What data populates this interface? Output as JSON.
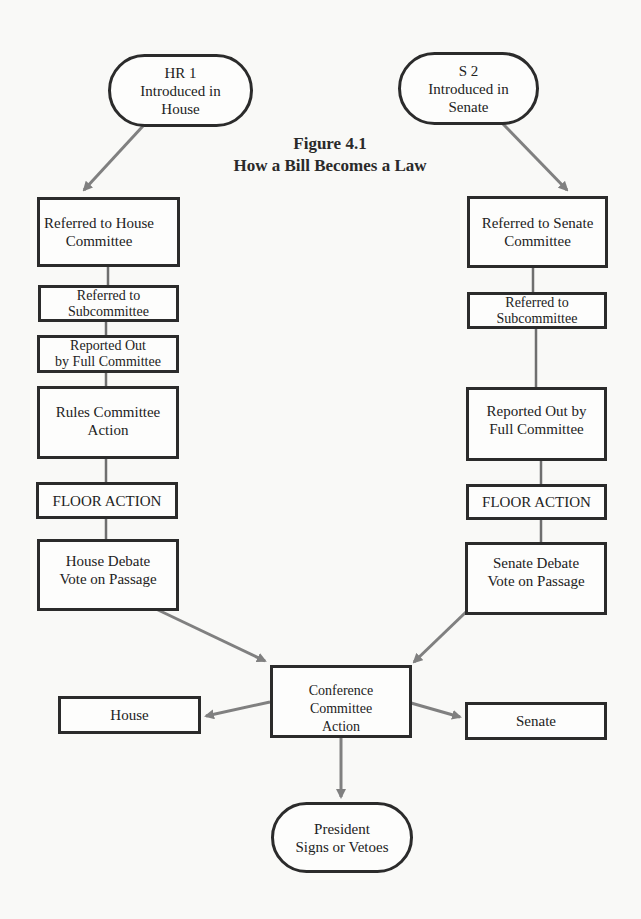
{
  "title": {
    "line1": "Figure 4.1",
    "line2": "How a Bill Becomes a Law"
  },
  "colors": {
    "background": "#f9f9f7",
    "box_border": "#2b2b2b",
    "arrow": "#808080",
    "connector": "#6f6f6f"
  },
  "nodes": {
    "hr1": {
      "label": "HR 1\nIntroduced in\nHouse",
      "shape": "oval"
    },
    "s2": {
      "label": "S 2\nIntroduced in\nSenate",
      "shape": "oval"
    },
    "house_committee": {
      "label": "Referred to House\nCommittee",
      "shape": "rect"
    },
    "house_subcommittee": {
      "label": "Referred to\nSubcommittee",
      "shape": "rect"
    },
    "house_reported": {
      "label": "Reported Out\nby Full Committee",
      "shape": "rect"
    },
    "rules": {
      "label": "Rules Committee\nAction",
      "shape": "rect"
    },
    "house_floor": {
      "label": "FLOOR ACTION",
      "shape": "rect"
    },
    "house_debate": {
      "label": "House Debate\nVote on Passage",
      "shape": "rect"
    },
    "senate_committee": {
      "label": "Referred to Senate\nCommittee",
      "shape": "rect"
    },
    "senate_subcommittee": {
      "label": "Referred to\nSubcommittee",
      "shape": "rect"
    },
    "senate_reported": {
      "label": "Reported Out by\nFull Committee",
      "shape": "rect"
    },
    "senate_floor": {
      "label": "FLOOR ACTION",
      "shape": "rect"
    },
    "senate_debate": {
      "label": "Senate Debate\nVote on Passage",
      "shape": "rect"
    },
    "conference": {
      "label": "Conference Committee\nAction",
      "shape": "rect"
    },
    "house_final": {
      "label": "House",
      "shape": "rect"
    },
    "senate_final": {
      "label": "Senate",
      "shape": "rect"
    },
    "president": {
      "label": "President\nSigns or Vetoes",
      "shape": "oval"
    }
  },
  "edges": [
    {
      "from": "hr1",
      "to": "house_committee",
      "type": "arrow"
    },
    {
      "from": "house_committee",
      "to": "house_subcommittee",
      "type": "line"
    },
    {
      "from": "house_subcommittee",
      "to": "house_reported",
      "type": "line"
    },
    {
      "from": "house_reported",
      "to": "rules",
      "type": "line"
    },
    {
      "from": "rules",
      "to": "house_floor",
      "type": "line"
    },
    {
      "from": "house_floor",
      "to": "house_debate",
      "type": "line"
    },
    {
      "from": "s2",
      "to": "senate_committee",
      "type": "arrow"
    },
    {
      "from": "senate_committee",
      "to": "senate_subcommittee",
      "type": "line"
    },
    {
      "from": "senate_subcommittee",
      "to": "senate_reported",
      "type": "line"
    },
    {
      "from": "senate_reported",
      "to": "senate_floor",
      "type": "line"
    },
    {
      "from": "senate_floor",
      "to": "senate_debate",
      "type": "line"
    },
    {
      "from": "house_debate",
      "to": "conference",
      "type": "arrow"
    },
    {
      "from": "senate_debate",
      "to": "conference",
      "type": "arrow"
    },
    {
      "from": "conference",
      "to": "house_final",
      "type": "arrow"
    },
    {
      "from": "conference",
      "to": "senate_final",
      "type": "arrow"
    },
    {
      "from": "conference",
      "to": "president",
      "type": "arrow"
    }
  ]
}
